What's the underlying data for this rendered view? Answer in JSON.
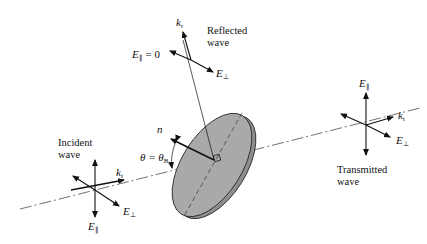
{
  "figure": {
    "type": "physics-diagram"
  },
  "labels": {
    "incident_wave_line1": "Incident",
    "incident_wave_line2": "wave",
    "reflected_wave_line1": "Reflected",
    "reflected_wave_line2": "wave",
    "transmitted_wave_line1": "Transmitted",
    "transmitted_wave_line2": "wave",
    "k_incident": "k",
    "k_incident_sub": "i",
    "k_reflected": "k",
    "k_reflected_sub": "r",
    "k_transmitted": "k",
    "k_transmitted_sub": "t",
    "E_par": "E",
    "E_par_sub": "∥",
    "E_perp": "E",
    "E_perp_sub": "⊥",
    "E_par_reflected_eq": "= 0",
    "normal": "n",
    "theta": "θ = θ",
    "theta_sub": "B"
  },
  "colors": {
    "ink": "#111111",
    "disk_fill": "#a9a9a9",
    "disk_edge": "#8f8f8f",
    "background": "#ffffff"
  }
}
